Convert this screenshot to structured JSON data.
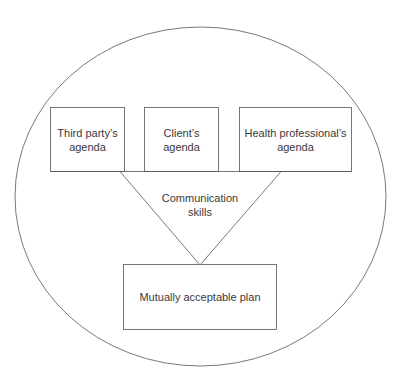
{
  "diagram": {
    "agendas": [
      {
        "label_line1": "Third party’s",
        "label_line2": "agenda"
      },
      {
        "label_line1": "Client’s",
        "label_line2": "agenda"
      },
      {
        "label_line1": "Health professional’s",
        "label_line2": "agenda"
      }
    ],
    "funnel": {
      "label_line1": "Communication",
      "label_line2": "skills"
    },
    "outcome": {
      "label": "Mutually acceptable plan"
    },
    "colors": {
      "stroke": "#555555",
      "text": "#3a3a3a",
      "background": "#ffffff"
    }
  }
}
